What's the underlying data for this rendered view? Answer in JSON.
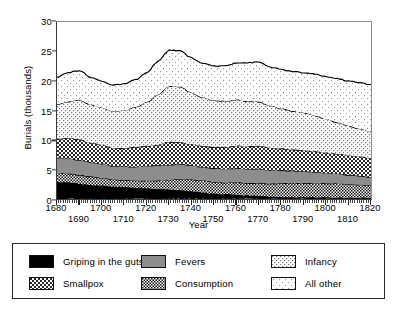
{
  "chart_data": {
    "type": "area",
    "title": "",
    "xlabel": "Year",
    "ylabel": "Burials (thousands)",
    "xlim": [
      1680,
      1820
    ],
    "ylim": [
      0,
      30
    ],
    "yticks": [
      0,
      5,
      10,
      15,
      20,
      25,
      30
    ],
    "xticks_row_a": [
      1680,
      1700,
      1720,
      1740,
      1760,
      1780,
      1800,
      1820
    ],
    "xticks_row_b": [
      1690,
      1710,
      1730,
      1750,
      1770,
      1790,
      1810
    ],
    "grid": false,
    "legend_position": "below-plot",
    "stacked": true,
    "x": [
      1680,
      1685,
      1690,
      1695,
      1700,
      1705,
      1710,
      1715,
      1720,
      1725,
      1730,
      1735,
      1740,
      1745,
      1750,
      1755,
      1760,
      1765,
      1770,
      1775,
      1780,
      1785,
      1790,
      1795,
      1800,
      1805,
      1810,
      1815,
      1820
    ],
    "series": [
      {
        "name": "Griping in the guts",
        "fill": "solid-black",
        "color": "#000000",
        "values": [
          2.9,
          2.8,
          2.6,
          2.4,
          2.3,
          2.1,
          2.0,
          1.9,
          1.8,
          1.7,
          1.6,
          1.5,
          1.3,
          1.1,
          0.9,
          0.8,
          0.7,
          0.6,
          0.5,
          0.4,
          0.35,
          0.3,
          0.3,
          0.25,
          0.25,
          0.2,
          0.2,
          0.2,
          0.2
        ]
      },
      {
        "name": "Consumption",
        "fill": "dense-check",
        "color": "#4a4a4a",
        "values": [
          1.4,
          1.5,
          1.5,
          1.4,
          1.3,
          1.2,
          1.2,
          1.2,
          1.3,
          1.4,
          1.6,
          1.9,
          2.0,
          2.0,
          2.0,
          2.0,
          2.1,
          2.1,
          2.2,
          2.2,
          2.3,
          2.4,
          2.4,
          2.4,
          2.4,
          2.4,
          2.3,
          2.2,
          2.1
        ]
      },
      {
        "name": "Fevers",
        "fill": "solid-gray",
        "color": "#8a8a8a",
        "values": [
          2.7,
          2.6,
          2.5,
          2.4,
          2.4,
          2.3,
          2.3,
          2.4,
          2.5,
          2.6,
          2.6,
          2.5,
          2.4,
          2.3,
          2.3,
          2.3,
          2.4,
          2.4,
          2.4,
          2.3,
          2.2,
          2.1,
          2.0,
          1.9,
          1.8,
          1.7,
          1.6,
          1.5,
          1.4
        ]
      },
      {
        "name": "Smallpox",
        "fill": "medium-check",
        "color": "#6f6f6f",
        "values": [
          3.2,
          3.4,
          3.5,
          3.3,
          3.2,
          3.0,
          3.1,
          3.3,
          3.4,
          3.5,
          3.9,
          3.7,
          3.6,
          3.6,
          3.6,
          3.7,
          3.8,
          3.8,
          3.9,
          3.8,
          3.7,
          3.6,
          3.6,
          3.5,
          3.4,
          3.4,
          3.3,
          3.3,
          3.2
        ]
      },
      {
        "name": "Infancy",
        "fill": "light-check",
        "color": "#d4d4d4",
        "values": [
          5.8,
          6.2,
          6.7,
          6.5,
          6.3,
          6.2,
          6.4,
          6.8,
          7.4,
          8.5,
          9.4,
          9.4,
          8.7,
          8.2,
          7.9,
          7.8,
          7.8,
          7.7,
          7.5,
          7.1,
          6.8,
          6.5,
          6.3,
          6.1,
          5.7,
          5.3,
          5.0,
          4.7,
          4.5
        ]
      },
      {
        "name": "All other",
        "fill": "sparse-dots",
        "color": "#f0f0f0",
        "values": [
          4.6,
          4.9,
          5.0,
          4.6,
          4.5,
          4.5,
          4.5,
          4.6,
          5.0,
          5.6,
          6.1,
          6.1,
          5.9,
          5.8,
          5.8,
          6.0,
          6.3,
          6.5,
          6.7,
          6.6,
          6.6,
          6.7,
          6.8,
          7.0,
          7.2,
          7.4,
          7.6,
          7.8,
          8.0
        ]
      }
    ],
    "totals_note": "stacked total peaks near 27 thousand around 1730"
  },
  "axes": {
    "ylabel": "Burials (thousands)",
    "xlabel": "Year"
  },
  "legend": {
    "items": [
      {
        "label": "Griping in the guts",
        "fill": "solid-black"
      },
      {
        "label": "Smallpox",
        "fill": "medium-check"
      },
      {
        "label": "Fevers",
        "fill": "solid-gray"
      },
      {
        "label": "Consumption",
        "fill": "dense-check"
      },
      {
        "label": "Infancy",
        "fill": "light-check"
      },
      {
        "label": "All other",
        "fill": "sparse-dots"
      }
    ]
  }
}
